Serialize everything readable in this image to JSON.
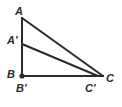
{
  "figure": {
    "kind": "geometry-diagram",
    "width": 122,
    "height": 107,
    "background_color": "#ffffff",
    "stroke_color": "#2b2b2b",
    "stroke_width": 2,
    "points": {
      "A": {
        "label": "A",
        "x": 22,
        "y": 18
      },
      "Aprime": {
        "label": "A'",
        "x": 22,
        "y": 44
      },
      "B": {
        "label": "B",
        "x": 22,
        "y": 76
      },
      "Bprime": {
        "label": "B'",
        "x": 22,
        "y": 76
      },
      "Cprime": {
        "label": "C'",
        "x": 98,
        "y": 76
      },
      "C": {
        "label": "C",
        "x": 103,
        "y": 76
      }
    },
    "vertex_markers": [
      {
        "name": "vertex-dot-B",
        "x": 22,
        "y": 76,
        "radius": 2.6,
        "color": "#2b2b2b"
      }
    ],
    "segments": [
      {
        "name": "segment-AB",
        "from": "A",
        "to": "B",
        "x1": 22,
        "y1": 18,
        "x2": 22,
        "y2": 76
      },
      {
        "name": "segment-BC",
        "from": "B",
        "to": "C",
        "x1": 22,
        "y1": 76,
        "x2": 103,
        "y2": 76
      },
      {
        "name": "segment-AC",
        "from": "A",
        "to": "C",
        "x1": 22,
        "y1": 18,
        "x2": 103,
        "y2": 76
      },
      {
        "name": "segment-ApCp",
        "from": "Aprime",
        "to": "Cprime",
        "x1": 22,
        "y1": 44,
        "x2": 98,
        "y2": 76
      }
    ],
    "labels": {
      "A": "A",
      "A_prime": "A'",
      "B": "B",
      "B_prime": "B'",
      "C_prime": "C'",
      "C": "C"
    }
  }
}
